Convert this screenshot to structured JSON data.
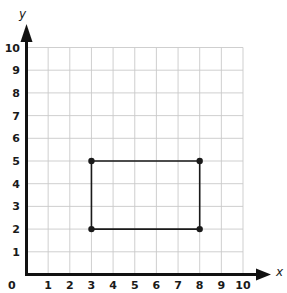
{
  "chart_data": {
    "type": "scatter",
    "title": "",
    "xlabel": "x",
    "ylabel": "y",
    "xlim": [
      0,
      10
    ],
    "ylim": [
      0,
      10
    ],
    "grid": true,
    "x_ticks": [
      "0",
      "1",
      "2",
      "3",
      "4",
      "5",
      "6",
      "7",
      "8",
      "9",
      "10"
    ],
    "y_ticks": [
      "1",
      "2",
      "3",
      "4",
      "5",
      "6",
      "7",
      "8",
      "9",
      "10"
    ],
    "origin_label": "0",
    "series": [
      {
        "name": "rectangle",
        "shape": "polygon",
        "closed": true,
        "points": [
          [
            3,
            2
          ],
          [
            8,
            2
          ],
          [
            8,
            5
          ],
          [
            3,
            5
          ]
        ]
      }
    ]
  },
  "colors": {
    "axis": "#111111",
    "grid": "#c9c9c9",
    "shape": "#1a1a1a",
    "background": "#ffffff"
  }
}
